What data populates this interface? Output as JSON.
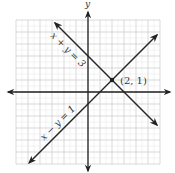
{
  "diagram": {
    "type": "coordinate-plane",
    "axis_labels": {
      "x": "x",
      "y": "y"
    },
    "grid": {
      "xmin": -6,
      "xmax": 6,
      "ymin": -6,
      "ymax": 6,
      "minor_step": 0.5,
      "major_step": 1
    },
    "lines": [
      {
        "equation": "x + y = 3",
        "label": "x + y = 3",
        "from": [
          -2.75,
          5.75
        ],
        "to": [
          5.75,
          -2.75
        ]
      },
      {
        "equation": "x − y = 1",
        "label": "x − y = 1",
        "from": [
          -4.9,
          -5.9
        ],
        "to": [
          5.75,
          4.75
        ]
      }
    ],
    "intersection": {
      "point": [
        2,
        1
      ],
      "label": "(2, 1)"
    }
  },
  "colors": {
    "grid_minor": "#e6e6e6",
    "grid_major": "#cfcfcf",
    "axes": "#222222",
    "lines": "#222222",
    "text": "#333333"
  }
}
